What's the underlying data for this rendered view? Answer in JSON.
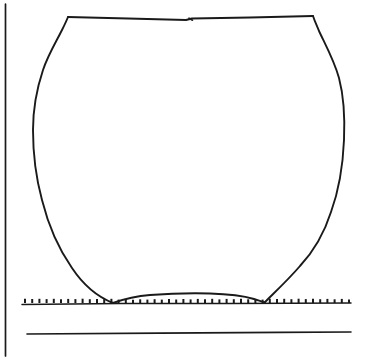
{
  "figure": {
    "kind": "archaeological-vessel-profile-drawing",
    "title": "",
    "caption": "",
    "background_color": "#ffffff",
    "ink_color": "#1a1a1a",
    "canvas": {
      "width": 366,
      "height": 360
    }
  },
  "drawing": {
    "vertical_axis_rule": {
      "x": 5.5,
      "y1": 4,
      "y2": 356
    },
    "rim": {
      "left_corner": {
        "x": 68,
        "y": 17
      },
      "right_corner": {
        "x": 313,
        "y": 16
      },
      "center_tick": {
        "x": 190,
        "y": 19
      },
      "path": "M 68 17 L 128 18.5 L 186 20 L 192 18.5 L 250 17.5 L 313 16"
    },
    "left_profile_path": "M 68 17 C 66 22 64 26 62 30 C 56 42 48 55 43 70 C 37 88 33 108 33 130 C 33 152 36 178 42 200 C 48 224 58 248 72 268 C 84 286 98 297 113 303",
    "right_profile_path": "M 313 16 C 315 22 317 26 319 31 C 325 44 334 60 339 78 C 344 97 345 118 344 140 C 343 164 339 190 331 212 C 324 234 313 252 300 266 C 288 280 275 292 265 302",
    "base_path": "M 113 303 C 124 299 136 296 150 295 C 170 293.5 190 293 210 293.5 C 228 294 244 296 254 299 C 259 300.5 263 301.8 265 302.3",
    "ground_line": {
      "x1": 22,
      "x2": 351,
      "y": 304
    },
    "ground_hatch": {
      "x_start": 23,
      "x_end": 350,
      "y_top": 298.5,
      "y_bottom": 303,
      "spacing": 7.2,
      "tick_count": 46
    },
    "baseline_rule": {
      "x1": 27,
      "x2": 351,
      "y1": 334,
      "y2": 332
    }
  },
  "measurements": {
    "rim_span_px": 245,
    "max_body_width_px": 311,
    "base_span_px": 152,
    "vessel_height_px": 287
  }
}
